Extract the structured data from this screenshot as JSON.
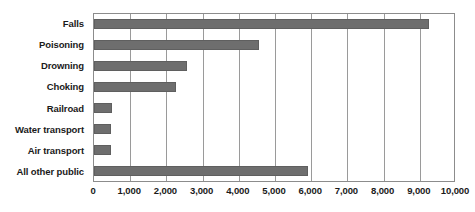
{
  "chart_data": {
    "type": "bar",
    "orientation": "horizontal",
    "title": "",
    "subtitle": "",
    "xlabel": "",
    "ylabel": "",
    "categories": [
      "Falls",
      "Poisoning",
      "Drowning",
      "Choking",
      "Railroad",
      "Water transport",
      "Air transport",
      "All other public"
    ],
    "values": [
      9250,
      4560,
      2570,
      2270,
      500,
      470,
      470,
      5900
    ],
    "series": [
      {
        "name": "",
        "values": [
          9250,
          4560,
          2570,
          2270,
          500,
          470,
          470,
          5900
        ]
      }
    ],
    "xlim": [
      0,
      10000
    ],
    "xticks": [
      0,
      1000,
      2000,
      3000,
      4000,
      5000,
      6000,
      7000,
      8000,
      9000,
      10000
    ],
    "xtick_labels": [
      "0",
      "1,000",
      "2,000",
      "3,000",
      "4,000",
      "5,000",
      "6,000",
      "7,000",
      "8,000",
      "9,000",
      "10,000"
    ],
    "grid": "vertical",
    "legend": "none",
    "annotations": [],
    "colors": {
      "bar_fill": "#6e6e6e",
      "bar_stroke": "#5f5f5f",
      "gridline": "#9a9a9a",
      "plot_border": "#8c8c8c",
      "background": "#ffffff",
      "text": "#1a1a1a"
    }
  }
}
